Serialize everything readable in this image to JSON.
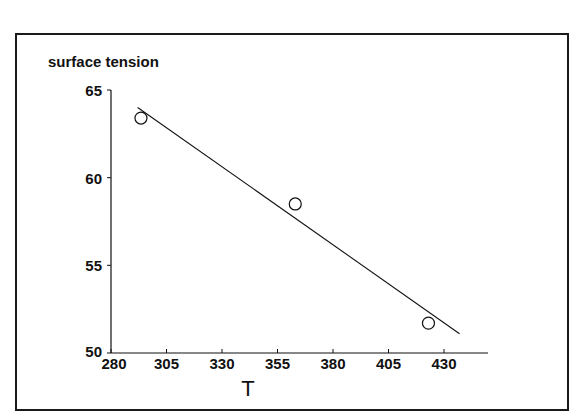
{
  "chart_data": {
    "type": "scatter",
    "title": "",
    "ylabel": "surface tension",
    "xlabel": "T",
    "xlim": [
      280,
      455
    ],
    "ylim": [
      50,
      65
    ],
    "x_ticks": [
      280,
      305,
      330,
      355,
      380,
      405,
      430
    ],
    "y_ticks": [
      50,
      55,
      60,
      65
    ],
    "grid": false,
    "legend": null,
    "series": [
      {
        "name": "observed",
        "marker": "open-circle",
        "points": [
          {
            "x": 293.5,
            "y": 63.4
          },
          {
            "x": 363,
            "y": 58.5
          },
          {
            "x": 423,
            "y": 51.7
          }
        ]
      },
      {
        "name": "fit",
        "kind": "line",
        "points": [
          {
            "x": 292,
            "y": 64.0
          },
          {
            "x": 437,
            "y": 51.1
          }
        ]
      }
    ]
  },
  "labels": {
    "y_axis_title": "surface tension",
    "x_axis_title": "T"
  },
  "colors": {
    "ink": "#111111",
    "background": "#ffffff"
  }
}
